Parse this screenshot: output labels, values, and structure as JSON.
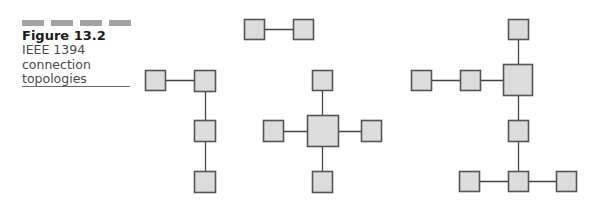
{
  "figure": {
    "number": "Figure 13.2",
    "caption_lines": [
      "IEEE 1394",
      "connection",
      "topologies"
    ]
  },
  "colors": {
    "node_fill": "#dcdcdc",
    "node_stroke": "#555555",
    "link": "#444444",
    "header_bars": "#a3a3a3"
  },
  "topologies": [
    {
      "name": "point-to-point",
      "nodes": [
        {
          "id": "a",
          "x": 244,
          "y": 19,
          "w": 20,
          "h": 20
        },
        {
          "id": "b",
          "x": 293,
          "y": 19,
          "w": 20,
          "h": 20
        }
      ],
      "links": [
        [
          "a",
          "b"
        ]
      ]
    },
    {
      "name": "daisy-chain",
      "nodes": [
        {
          "id": "a",
          "x": 145,
          "y": 70,
          "w": 20,
          "h": 20
        },
        {
          "id": "b",
          "x": 194,
          "y": 70,
          "w": 21,
          "h": 21
        },
        {
          "id": "c",
          "x": 194,
          "y": 120,
          "w": 21,
          "h": 21
        },
        {
          "id": "d",
          "x": 194,
          "y": 171,
          "w": 21,
          "h": 21
        }
      ],
      "links": [
        [
          "a",
          "b"
        ],
        [
          "b",
          "c"
        ],
        [
          "c",
          "d"
        ]
      ]
    },
    {
      "name": "star",
      "nodes": [
        {
          "id": "top",
          "x": 312,
          "y": 70,
          "w": 20,
          "h": 20
        },
        {
          "id": "left",
          "x": 263,
          "y": 120,
          "w": 20,
          "h": 21
        },
        {
          "id": "hub",
          "x": 307,
          "y": 115,
          "w": 31,
          "h": 31
        },
        {
          "id": "right",
          "x": 361,
          "y": 120,
          "w": 20,
          "h": 21
        },
        {
          "id": "bottom",
          "x": 312,
          "y": 171,
          "w": 20,
          "h": 21
        }
      ],
      "links": [
        [
          "top",
          "hub"
        ],
        [
          "left",
          "hub"
        ],
        [
          "hub",
          "right"
        ],
        [
          "hub",
          "bottom"
        ]
      ]
    },
    {
      "name": "tree",
      "nodes": [
        {
          "id": "top",
          "x": 508,
          "y": 19,
          "w": 20,
          "h": 20
        },
        {
          "id": "l1",
          "x": 411,
          "y": 70,
          "w": 20,
          "h": 20
        },
        {
          "id": "l2",
          "x": 460,
          "y": 70,
          "w": 20,
          "h": 20
        },
        {
          "id": "hub",
          "x": 503,
          "y": 64,
          "w": 29,
          "h": 31
        },
        {
          "id": "mid",
          "x": 508,
          "y": 120,
          "w": 20,
          "h": 21
        },
        {
          "id": "bl",
          "x": 459,
          "y": 171,
          "w": 20,
          "h": 20
        },
        {
          "id": "bc",
          "x": 508,
          "y": 171,
          "w": 20,
          "h": 20
        },
        {
          "id": "br",
          "x": 556,
          "y": 171,
          "w": 20,
          "h": 20
        }
      ],
      "links": [
        [
          "top",
          "hub"
        ],
        [
          "l1",
          "l2"
        ],
        [
          "l2",
          "hub"
        ],
        [
          "hub",
          "mid"
        ],
        [
          "mid",
          "bc"
        ],
        [
          "bl",
          "bc"
        ],
        [
          "bc",
          "br"
        ]
      ]
    }
  ]
}
